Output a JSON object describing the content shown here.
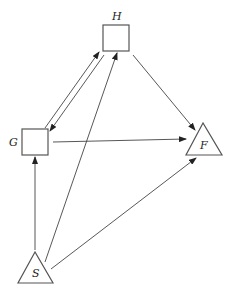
{
  "diagram": {
    "type": "directed-graph",
    "nodes": [
      {
        "id": "H",
        "label": "H",
        "shape": "square"
      },
      {
        "id": "G",
        "label": "G",
        "shape": "square"
      },
      {
        "id": "F",
        "label": "F",
        "shape": "triangle"
      },
      {
        "id": "S",
        "label": "S",
        "shape": "triangle"
      }
    ],
    "edges": [
      {
        "from": "G",
        "to": "H"
      },
      {
        "from": "H",
        "to": "G"
      },
      {
        "from": "H",
        "to": "F"
      },
      {
        "from": "G",
        "to": "F"
      },
      {
        "from": "S",
        "to": "G"
      },
      {
        "from": "S",
        "to": "H"
      },
      {
        "from": "S",
        "to": "F"
      }
    ],
    "colors": {
      "stroke": "#555555",
      "background": "#ffffff"
    }
  }
}
